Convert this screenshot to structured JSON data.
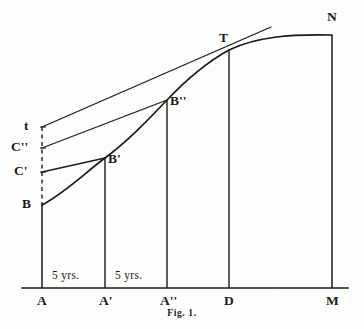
{
  "figure": {
    "caption": "Fig. 1.",
    "width": 364,
    "height": 329,
    "ink_color": "#1a1a1a",
    "paper_color": "#fdfdfc"
  },
  "axis": {
    "name": "horizontal-time-axis",
    "y": 288,
    "x_start": 22,
    "x_end": 348,
    "ticks": [
      {
        "label": "A",
        "x": 42
      },
      {
        "label": "A'",
        "x": 105
      },
      {
        "label": "A''",
        "x": 167
      },
      {
        "label": "D",
        "x": 229
      },
      {
        "label": "M",
        "x": 332
      }
    ]
  },
  "intervals": [
    {
      "label": "5 yrs.",
      "from": "A",
      "to": "A'",
      "center_x": 73,
      "y": 276
    },
    {
      "label": "5 yrs.",
      "from": "A'",
      "to": "A''",
      "center_x": 136,
      "y": 276
    }
  ],
  "verticals": [
    {
      "name": "ordinate-A",
      "x": 42,
      "y_top": 127,
      "y_bottom": 288,
      "dashed_from": 127,
      "dashed_to": 205
    },
    {
      "name": "ordinate-A1",
      "x": 105,
      "y_top": 158,
      "y_bottom": 288,
      "dashed_from": null,
      "dashed_to": null
    },
    {
      "name": "ordinate-A2",
      "x": 167,
      "y_top": 100,
      "y_bottom": 288,
      "dashed_from": null,
      "dashed_to": null
    },
    {
      "name": "ordinate-D",
      "x": 229,
      "y_top": 50,
      "y_bottom": 288,
      "dashed_from": null,
      "dashed_to": null
    },
    {
      "name": "ordinate-M",
      "x": 332,
      "y_top": 35,
      "y_bottom": 288,
      "dashed_from": null,
      "dashed_to": null
    }
  ],
  "points": [
    {
      "label": "B",
      "x": 42,
      "y": 205,
      "label_x": 24,
      "label_y": 198,
      "on": "curve-start"
    },
    {
      "label": "C'",
      "x": 42,
      "y": 172,
      "label_x": 18,
      "label_y": 165,
      "on": "ordinate-A"
    },
    {
      "label": "C''",
      "x": 42,
      "y": 148,
      "label_x": 14,
      "label_y": 141,
      "on": "ordinate-A"
    },
    {
      "label": "t",
      "x": 42,
      "y": 127,
      "label_x": 24,
      "label_y": 120,
      "on": "ordinate-A"
    },
    {
      "label": "B'",
      "x": 105,
      "y": 158,
      "label_x": 108,
      "label_y": 154,
      "on": "curve"
    },
    {
      "label": "B''",
      "x": 167,
      "y": 100,
      "label_x": 170,
      "label_y": 96,
      "on": "curve"
    },
    {
      "label": "T",
      "x": 229,
      "y": 50,
      "label_x": 219,
      "label_y": 33,
      "on": "curve-tangency"
    },
    {
      "label": "N",
      "x": 332,
      "y": 35,
      "label_x": 327,
      "label_y": 12,
      "on": "curve-end"
    }
  ],
  "curve": {
    "name": "growth-curve-BTN",
    "description": "growth curve rising from B through B', B'', tangency T, flattening to N",
    "path": "M 42 205 C 66 192, 86 172, 105 158 C 128 141, 148 120, 167 100 C 187 79, 209 61, 229 50 C 256 37, 290 34, 332 35"
  },
  "chords": [
    {
      "name": "tangent-line-tT",
      "from_label": "t",
      "to_label": "T",
      "x1": 42,
      "y1": 127,
      "x2": 271,
      "y2": 27,
      "note": "tangent touching curve at T, extended beyond"
    },
    {
      "name": "chord-C2-B2",
      "from_label": "C''",
      "to_label": "B''",
      "x1": 42,
      "y1": 148,
      "x2": 167,
      "y2": 100
    },
    {
      "name": "chord-C1-B1",
      "from_label": "C'",
      "to_label": "B'",
      "x1": 42,
      "y1": 172,
      "x2": 105,
      "y2": 158
    }
  ]
}
